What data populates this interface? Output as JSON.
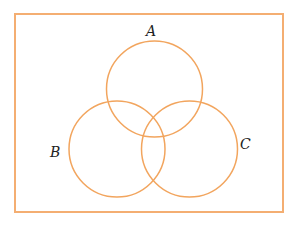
{
  "diagram": {
    "type": "venn",
    "universe": {
      "x": 15,
      "y": 14,
      "width": 268,
      "height": 198,
      "stroke": "#F4AE72"
    },
    "circle_stroke": "#F2A55E",
    "sets": [
      {
        "id": "A",
        "label": "A",
        "cx": 154.5,
        "cy": 89,
        "r": 48,
        "label_x": 146,
        "label_y": 24
      },
      {
        "id": "B",
        "label": "B",
        "cx": 117,
        "cy": 149,
        "r": 48,
        "label_x": 50,
        "label_y": 145
      },
      {
        "id": "C",
        "label": "C",
        "cx": 189.5,
        "cy": 149,
        "r": 48,
        "label_x": 240,
        "label_y": 137
      }
    ]
  }
}
